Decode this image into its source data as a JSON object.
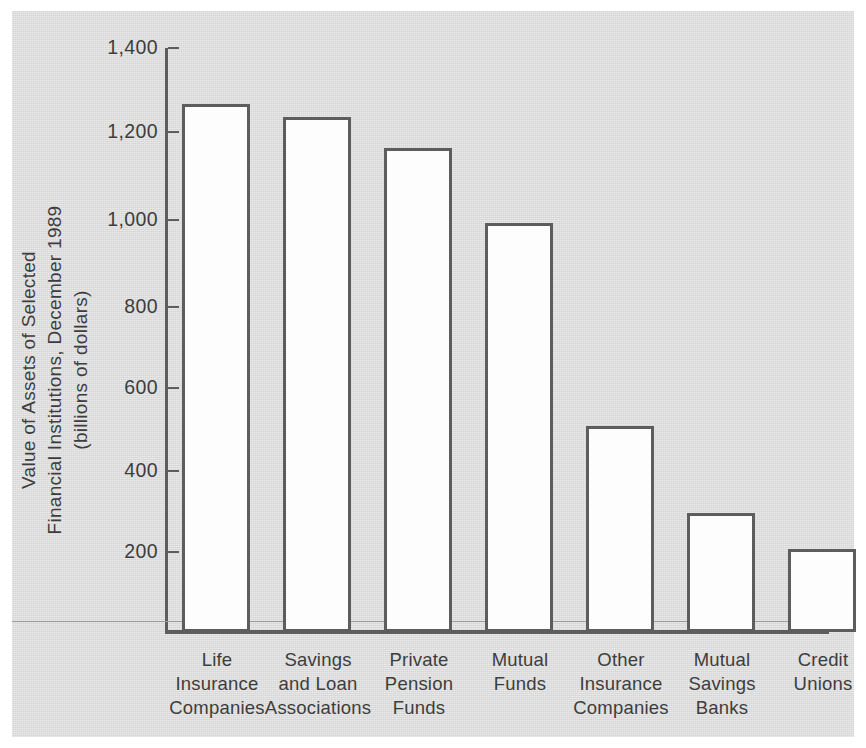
{
  "chart_data": {
    "type": "bar",
    "title": "",
    "xlabel": "",
    "ylabel": "Value of Assets of Selected Financial Institutions, December 1989 (billions of dollars)",
    "ylabel_lines": [
      "Value of Assets of Selected",
      "Financial Institutions, December 1989",
      "(billions of dollars)"
    ],
    "categories": [
      "Life Insurance Companies",
      "Savings and Loan Associations",
      "Private Pension Funds",
      "Mutual Funds",
      "Other Insurance Companies",
      "Mutual Savings Banks",
      "Credit Unions"
    ],
    "category_label_lines": [
      "Life\nInsurance\nCompanies",
      "Savings\nand Loan\nAssociations",
      "Private\nPension\nFunds",
      "Mutual\nFunds",
      "Other\nInsurance\nCompanies",
      "Mutual\nSavings\nBanks",
      "Credit\nUnions"
    ],
    "values": [
      1265,
      1235,
      1160,
      980,
      495,
      285,
      200
    ],
    "ylim": [
      0,
      1400
    ],
    "yticks": [
      200,
      400,
      600,
      800,
      1000,
      1200,
      1400
    ],
    "ytick_labels": [
      "200",
      "400",
      "600",
      "800",
      "1,000",
      "1,200",
      "1,400"
    ],
    "grid": false,
    "legend": false,
    "units": "billions of dollars",
    "colors": {
      "panel_background": "#d5d5d5",
      "bar_fill": "#fdfdfd",
      "bar_outline": "#5d5d5d",
      "axis": "#5d5d5d",
      "text": "#3d3d3d"
    }
  }
}
